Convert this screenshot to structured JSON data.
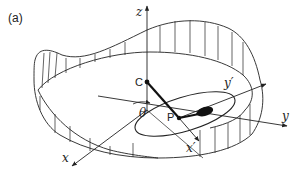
{
  "figure": {
    "panel_label": "(a)",
    "labels": {
      "z": "z",
      "x": "x",
      "y": "y",
      "y_prime": "y′",
      "x_prime": "x′",
      "theta": "θ",
      "C": "C",
      "P": "P"
    },
    "colors": {
      "line": "#222222",
      "background": "#ffffff"
    }
  }
}
